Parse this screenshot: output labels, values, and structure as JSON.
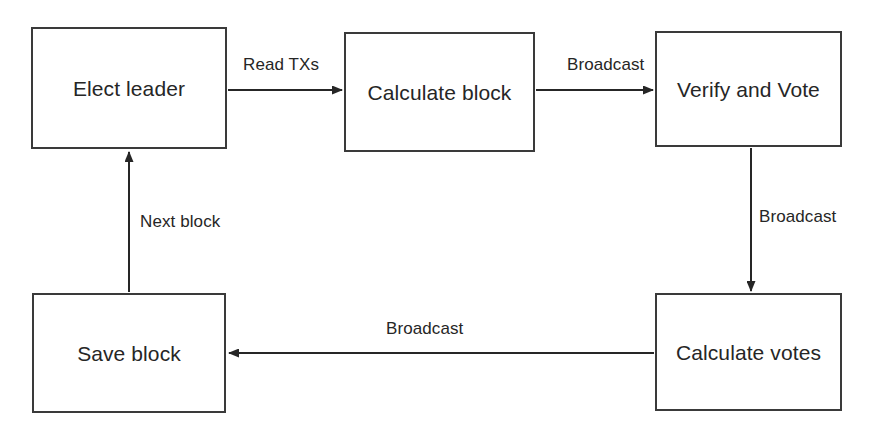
{
  "diagram": {
    "type": "flowchart",
    "canvas": {
      "width": 877,
      "height": 440
    },
    "style": {
      "background": "#ffffff",
      "stroke": "#3a3a3a",
      "text": "#262626",
      "node_fill": "#ffffff"
    },
    "nodes": [
      {
        "id": "elect-leader",
        "label": "Elect leader",
        "x": 31,
        "y": 27,
        "width": 196,
        "height": 122
      },
      {
        "id": "calculate-block",
        "label": "Calculate block",
        "x": 344,
        "y": 32,
        "width": 191,
        "height": 120
      },
      {
        "id": "verify-and-vote",
        "label": "Verify and Vote",
        "x": 655,
        "y": 31,
        "width": 187,
        "height": 116
      },
      {
        "id": "save-block",
        "label": "Save block",
        "x": 32,
        "y": 293,
        "width": 194,
        "height": 120
      },
      {
        "id": "calculate-votes",
        "label": "Calculate votes",
        "x": 655,
        "y": 293,
        "width": 187,
        "height": 118
      }
    ],
    "edges": [
      {
        "id": "edge-read-txs",
        "from": "elect-leader",
        "to": "calculate-block",
        "label": "Read TXs",
        "direction": "right",
        "label_x": 243,
        "label_y": 56
      },
      {
        "id": "edge-broadcast-block",
        "from": "calculate-block",
        "to": "verify-and-vote",
        "label": "Broadcast",
        "direction": "right",
        "label_x": 567,
        "label_y": 56
      },
      {
        "id": "edge-broadcast-vote",
        "from": "verify-and-vote",
        "to": "calculate-votes",
        "label": "Broadcast",
        "direction": "down",
        "label_x": 759,
        "label_y": 208
      },
      {
        "id": "edge-broadcast-result",
        "from": "calculate-votes",
        "to": "save-block",
        "label": "Broadcast",
        "direction": "left",
        "label_x": 386,
        "label_y": 320
      },
      {
        "id": "edge-next-block",
        "from": "save-block",
        "to": "elect-leader",
        "label": "Next block",
        "direction": "up",
        "label_x": 140,
        "label_y": 213
      }
    ]
  }
}
